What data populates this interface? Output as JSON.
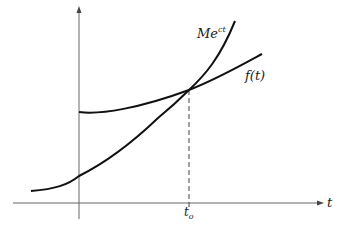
{
  "diagram": {
    "type": "function-comparison-plot",
    "axes": {
      "x_label": "t",
      "y_label": "",
      "x_tick_label_base": "t",
      "x_tick_label_sub": "o"
    },
    "curves": [
      {
        "name": "exponential",
        "label_base": "Me",
        "label_sup": "ct"
      },
      {
        "name": "f",
        "label": "f(t)"
      }
    ],
    "colors": {
      "stroke": "#111111",
      "axis": "#555555",
      "background": "#ffffff"
    }
  }
}
